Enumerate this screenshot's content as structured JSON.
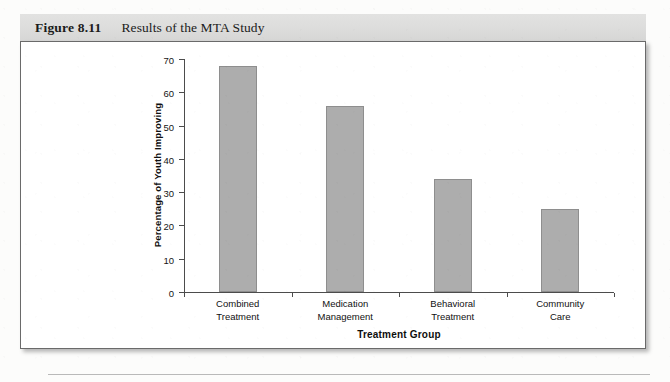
{
  "figure": {
    "number": "Figure 8.11",
    "title": "Results of the MTA Study"
  },
  "chart_data": {
    "type": "bar",
    "title": "",
    "categories": [
      "Combined Treatment",
      "Medication Management",
      "Behavioral Treatment",
      "Community Care"
    ],
    "category_lines": [
      [
        "Combined",
        "Treatment"
      ],
      [
        "Medication",
        "Management"
      ],
      [
        "Behavioral",
        "Treatment"
      ],
      [
        "Community",
        "Care"
      ]
    ],
    "values": [
      68,
      56,
      34,
      25
    ],
    "xlabel": "Treatment Group",
    "ylabel": "Percentage of Youth Improving",
    "ylim": [
      0,
      70
    ],
    "yticks": [
      0,
      10,
      20,
      30,
      40,
      50,
      60,
      70
    ],
    "ytick_labels": [
      "0",
      "10",
      "20",
      "30",
      "40",
      "50",
      "60",
      "70"
    ],
    "grid": false,
    "legend": false,
    "bar_color": "#adadad",
    "bar_edge_color": "#8e8e8e",
    "axis_color": "#4c4c4c"
  }
}
